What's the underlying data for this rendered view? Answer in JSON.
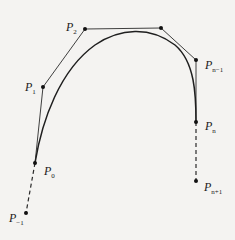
{
  "diagram": {
    "type": "spline-control-polygon",
    "colors": {
      "line": "#2a2a2a",
      "curve": "#1f1f1f",
      "background": "#f4f3f1"
    },
    "points": [
      {
        "id": "p-minus-1",
        "label": "P",
        "sub": "−1",
        "x": 26,
        "y": 213,
        "lx": 9,
        "ly": 222
      },
      {
        "id": "p0",
        "label": "P",
        "sub": "0",
        "x": 35,
        "y": 163,
        "lx": 44,
        "ly": 175
      },
      {
        "id": "p1",
        "label": "P",
        "sub": "1",
        "x": 43,
        "y": 87,
        "lx": 25,
        "ly": 91
      },
      {
        "id": "p2",
        "label": "P",
        "sub": "2",
        "x": 85,
        "y": 29,
        "lx": 66,
        "ly": 31
      },
      {
        "id": "p-n-2",
        "label": "",
        "sub": "",
        "x": 161,
        "y": 28,
        "lx": 0,
        "ly": 0
      },
      {
        "id": "p-n-1",
        "label": "P",
        "sub": "n−1",
        "x": 196,
        "y": 60,
        "lx": 205,
        "ly": 69
      },
      {
        "id": "p-n",
        "label": "P",
        "sub": "n",
        "x": 196,
        "y": 122,
        "lx": 205,
        "ly": 130
      },
      {
        "id": "p-n-plus-1",
        "label": "P",
        "sub": "n+1",
        "x": 196,
        "y": 181,
        "lx": 204,
        "ly": 191
      }
    ]
  }
}
